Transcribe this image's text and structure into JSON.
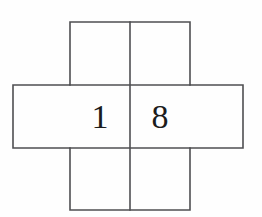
{
  "figure": {
    "type": "cube-net-cross",
    "background_color": "#fefefe",
    "line_color": "#4f4f52",
    "line_width": 1.6,
    "digit_color": "#1c1c1c",
    "digit_font_size": 34,
    "geometry": {
      "columns_x": [
        13,
        70,
        130,
        190,
        243
      ],
      "rows_y": [
        22,
        85,
        148,
        210
      ],
      "center_column_left": 70,
      "center_column_right": 190,
      "middle_row_top": 85,
      "middle_row_bottom": 148,
      "vertical_split_x": 130
    },
    "cells": [
      {
        "name": "top-left-cell",
        "label": "",
        "x": 70,
        "y": 22,
        "width": 60,
        "height": 63,
        "center_x": 100,
        "center_y": 53
      },
      {
        "name": "top-right-cell",
        "label": "",
        "x": 130,
        "y": 22,
        "width": 60,
        "height": 63,
        "center_x": 160,
        "center_y": 53
      },
      {
        "name": "middle-left-arm-cell",
        "label": "",
        "x": 13,
        "y": 85,
        "width": 57,
        "height": 63,
        "center_x": 41,
        "center_y": 116
      },
      {
        "name": "middle-center-left-cell",
        "label": "1",
        "x": 70,
        "y": 85,
        "width": 60,
        "height": 63,
        "center_x": 100,
        "center_y": 116,
        "baseline_y": 128
      },
      {
        "name": "middle-center-right-cell",
        "label": "8",
        "x": 130,
        "y": 85,
        "width": 60,
        "height": 63,
        "center_x": 160,
        "center_y": 116,
        "baseline_y": 128
      },
      {
        "name": "middle-right-arm-cell",
        "label": "",
        "x": 190,
        "y": 85,
        "width": 53,
        "height": 63,
        "center_x": 216,
        "center_y": 116
      },
      {
        "name": "bottom-left-cell",
        "label": "",
        "x": 70,
        "y": 148,
        "width": 60,
        "height": 62,
        "center_x": 100,
        "center_y": 179
      },
      {
        "name": "bottom-right-cell",
        "label": "",
        "x": 130,
        "y": 148,
        "width": 60,
        "height": 62,
        "center_x": 160,
        "center_y": 179
      }
    ],
    "digits": [
      {
        "name": "digit-one",
        "value": "1",
        "x": 100,
        "baseline_y": 128
      },
      {
        "name": "digit-eight",
        "value": "8",
        "x": 160,
        "baseline_y": 128
      }
    ],
    "segments": {
      "outline_path": "M 70 22 L 190 22 L 190 85 L 243 85 L 243 148 L 190 148 L 190 210 L 70 210 L 70 148 L 13 148 L 13 85 L 70 85 Z",
      "inner_vertical_center": "M 130 22 L 130 210",
      "inner_horizontal_top": "M 70 85 L 190 85",
      "inner_horizontal_bottom": "M 70 148 L 190 148"
    }
  }
}
